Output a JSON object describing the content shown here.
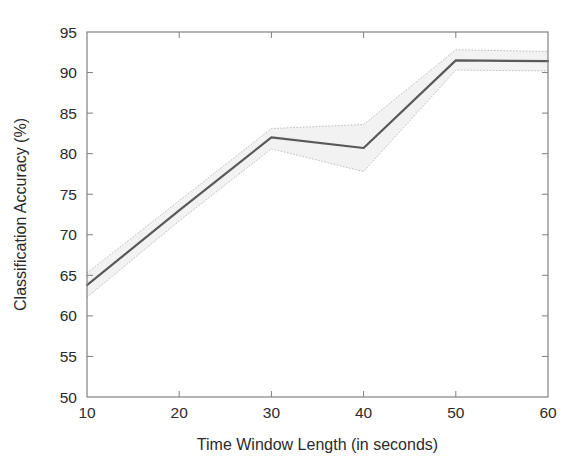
{
  "chart_data": {
    "type": "line",
    "title": "",
    "xlabel": "Time Window Length (in seconds)",
    "ylabel": "Classification Accuracy (%)",
    "xlim": [
      10,
      60
    ],
    "ylim": [
      50,
      95
    ],
    "xticks": [
      10,
      20,
      30,
      40,
      50,
      60
    ],
    "yticks": [
      50,
      55,
      60,
      65,
      70,
      75,
      80,
      85,
      90,
      95
    ],
    "xtick_labels": [
      "10",
      "20",
      "30",
      "40",
      "50",
      "60"
    ],
    "ytick_labels": [
      "50",
      "55",
      "60",
      "65",
      "70",
      "75",
      "80",
      "85",
      "90",
      "95"
    ],
    "grid": false,
    "legend": null,
    "legend_position": "none",
    "x": [
      10,
      20,
      30,
      40,
      50,
      60
    ],
    "series": [
      {
        "name": "Classification Accuracy",
        "values": [
          63.8,
          73.0,
          82.0,
          80.7,
          91.5,
          91.4
        ],
        "color": "#595959",
        "linewidth": 2.2,
        "style": "solid"
      }
    ],
    "error_band": {
      "name": "Confidence interval",
      "upper": [
        65.3,
        74.2,
        83.1,
        83.6,
        92.8,
        92.6
      ],
      "lower": [
        62.3,
        71.7,
        80.6,
        77.8,
        90.3,
        90.2
      ],
      "fill_color": "#f2f2f2",
      "edge_color": "#bdbdbd",
      "edge_style": "dotted"
    },
    "axes": {
      "frame_color": "#808080",
      "tick_direction": "in",
      "background": "#ffffff"
    }
  },
  "figure": {
    "background_color": "#ffffff",
    "width": 582,
    "height": 472
  }
}
